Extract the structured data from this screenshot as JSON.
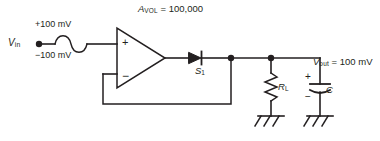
{
  "figure": {
    "stroke_color": "#231f20",
    "background_color": "#ffffff"
  },
  "labels": {
    "gain": {
      "symbol": "A",
      "subscript": "VOL",
      "equals": " = ",
      "value": "100,000",
      "full": "A_VOL = 100,000"
    },
    "vin": {
      "symbol": "V",
      "subscript": "in"
    },
    "amplitude_positive": "+100 mV",
    "amplitude_negative": "−100 mV",
    "diode": {
      "symbol": "S",
      "subscript": "1"
    },
    "resistor": {
      "symbol": "R",
      "subscript": "L"
    },
    "capacitor": {
      "symbol": "C"
    },
    "vout": {
      "symbol": "V",
      "subscript": "out",
      "equals": " = ",
      "value": "100 mV",
      "full": "V_out = 100 mV"
    },
    "opamp_noninverting": "+",
    "opamp_inverting": "−",
    "capacitor_positive": "+",
    "capacitor_negative": "−"
  },
  "components": [
    {
      "name": "op-amp",
      "type": "triangle-amplifier",
      "gain": "100,000"
    },
    {
      "name": "diode",
      "type": "diode",
      "label": "S1"
    },
    {
      "name": "load-resistor",
      "type": "resistor",
      "label": "RL"
    },
    {
      "name": "capacitor",
      "type": "polarized-capacitor",
      "label": "C"
    },
    {
      "name": "source",
      "type": "sine-source",
      "label": "Vin"
    },
    {
      "name": "ground-resistor",
      "type": "chassis-ground"
    },
    {
      "name": "ground-capacitor",
      "type": "chassis-ground"
    }
  ]
}
